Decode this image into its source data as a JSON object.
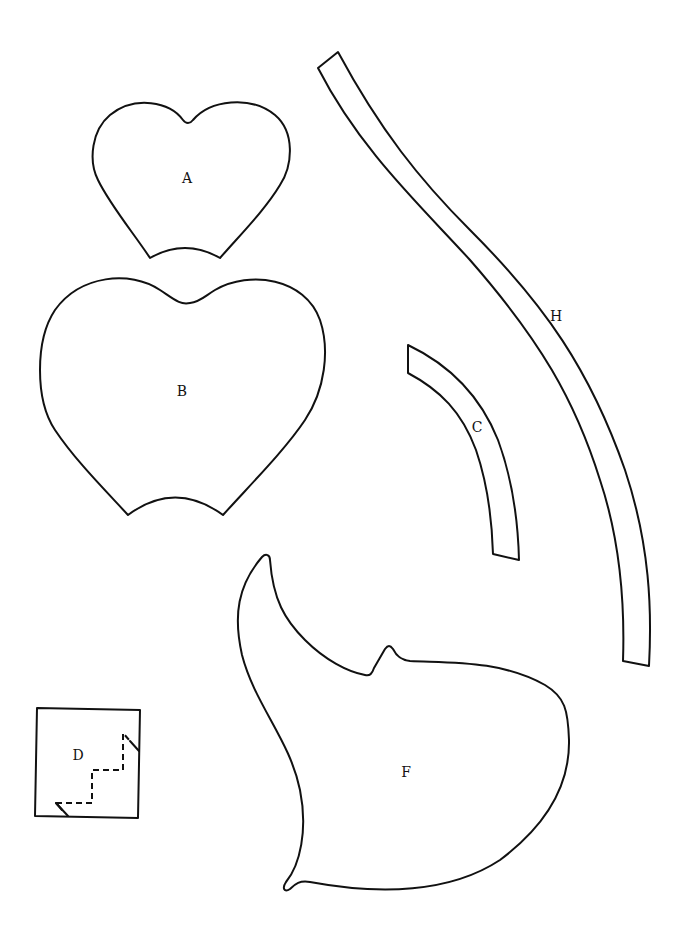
{
  "document": {
    "type": "sewing pattern pieces",
    "stroke_color": "#111111",
    "background_color": "#ffffff"
  },
  "pieces": {
    "A": {
      "label": "A",
      "shape": "small heart with concave bottom edge"
    },
    "B": {
      "label": "B",
      "shape": "large heart with concave bottom edge"
    },
    "C": {
      "label": "C",
      "shape": "short curved strip"
    },
    "D": {
      "label": "D",
      "shape": "square with dashed stepped fold line"
    },
    "F": {
      "label": "F",
      "shape": "irregular curved body with spike and notch"
    },
    "H": {
      "label": "H",
      "shape": "long S-curved strip"
    }
  }
}
